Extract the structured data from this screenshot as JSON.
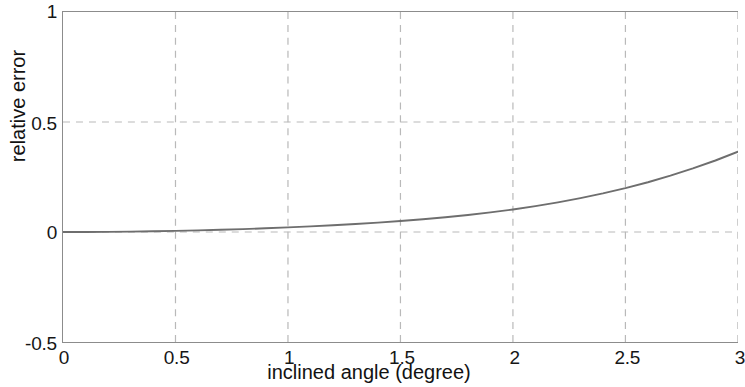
{
  "chart_data": {
    "type": "line",
    "title": "",
    "xlabel": "inclined angle (degree)",
    "ylabel": "relative error",
    "xlim": [
      0,
      3
    ],
    "ylim": [
      -0.5,
      1
    ],
    "xticks": [
      "0",
      "0.5",
      "1",
      "1.5",
      "2",
      "2.5",
      "3"
    ],
    "xtick_values": [
      0,
      0.5,
      1,
      1.5,
      2,
      2.5,
      3
    ],
    "yticks": [
      "1",
      "0.5",
      "0",
      "-0.5"
    ],
    "ytick_values": [
      1,
      0.5,
      0,
      -0.5
    ],
    "grid": true,
    "grid_style": "dashed",
    "grid_color": "#b9b9b9",
    "legend": null,
    "line_color": "#6e6e6e",
    "series": [
      {
        "name": "relative error",
        "x": [
          0.0,
          0.1,
          0.2,
          0.3,
          0.4,
          0.5,
          0.6,
          0.7,
          0.8,
          0.9,
          1.0,
          1.1,
          1.2,
          1.3,
          1.4,
          1.5,
          1.6,
          1.7,
          1.8,
          1.9,
          2.0,
          2.1,
          2.2,
          2.3,
          2.4,
          2.5,
          2.6,
          2.7,
          2.8,
          2.9,
          3.0
        ],
        "values": [
          0.0,
          0.0002,
          0.0008,
          0.0018,
          0.0032,
          0.0051,
          0.0074,
          0.0101,
          0.0133,
          0.0169,
          0.0209,
          0.0255,
          0.0306,
          0.0363,
          0.0427,
          0.0499,
          0.058,
          0.0672,
          0.0775,
          0.0892,
          0.1025,
          0.1176,
          0.1346,
          0.1538,
          0.1753,
          0.1994,
          0.2262,
          0.256,
          0.2889,
          0.325,
          0.365
        ]
      }
    ]
  },
  "axis_titles": {
    "x": "inclined angle (degree)",
    "y": "relative error"
  }
}
